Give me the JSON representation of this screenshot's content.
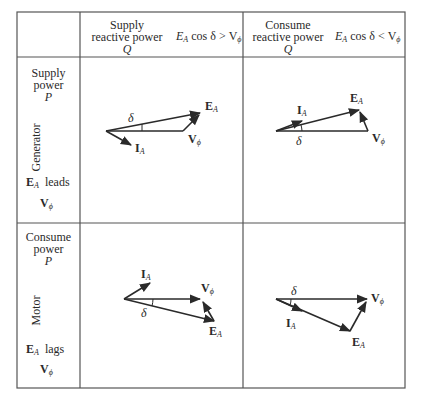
{
  "header": {
    "col1": {
      "line1": "Supply",
      "line2": "reactive power",
      "line3": "Q",
      "condition": "E",
      "condition_sub": "A",
      "condition_rest": " cos δ > V",
      "condition_rest_sub": "ϕ"
    },
    "col2": {
      "line1": "Consume",
      "line2": "reactive power",
      "line3": "Q",
      "condition": "E",
      "condition_sub": "A",
      "condition_rest": " cos δ < V",
      "condition_rest_sub": "ϕ"
    }
  },
  "rows": [
    {
      "line1": "Supply",
      "line2": "power",
      "line3": "P",
      "mode": "Generator",
      "relation_e": "E",
      "relation_e_sub": "A",
      "relation_word": "leads",
      "relation_v": "V",
      "relation_v_sub": "ϕ"
    },
    {
      "line1": "Consume",
      "line2": "power",
      "line3": "P",
      "mode": "Motor",
      "relation_e": "E",
      "relation_e_sub": "A",
      "relation_word": "lags",
      "relation_v": "V",
      "relation_v_sub": "ϕ"
    }
  ],
  "phasors": {
    "label_E": "E",
    "label_sub_A": "A",
    "label_I": "I",
    "label_V": "V",
    "label_sub_phi": "ϕ",
    "label_delta": "δ"
  },
  "colors": {
    "line": "#2a2a2a",
    "border": "#555555",
    "background": "#ffffff"
  }
}
